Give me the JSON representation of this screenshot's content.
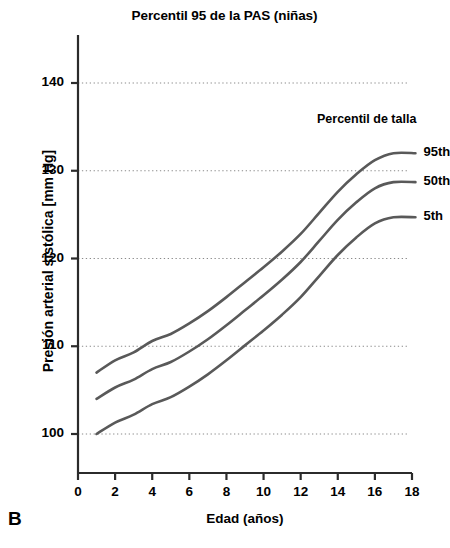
{
  "chart_data": {
    "type": "line",
    "title": "Percentil 95 de la PAS (niñas)",
    "panel_label": "B",
    "xlabel": "Edad (años)",
    "ylabel": "Presión arterial sistólica [mm Hg]",
    "xlim": [
      0,
      18
    ],
    "ylim": [
      96,
      145
    ],
    "xticks": [
      0,
      2,
      4,
      6,
      8,
      10,
      12,
      14,
      16,
      18
    ],
    "yticks": [
      100,
      110,
      120,
      130,
      140
    ],
    "grid": "horizontal-dotted",
    "legend_title": "Percentil de talla",
    "legend_position": "right-inline-at-line-ends",
    "line_color": "#595959",
    "x": [
      1,
      2,
      3,
      4,
      5,
      6,
      7,
      8,
      9,
      10,
      11,
      12,
      13,
      14,
      15,
      16,
      17
    ],
    "series": [
      {
        "name": "95th",
        "label": "95th",
        "values": [
          107.0,
          108.4,
          109.3,
          110.6,
          111.4,
          112.6,
          114.0,
          115.6,
          117.3,
          119.0,
          120.8,
          122.8,
          125.2,
          127.6,
          129.6,
          131.2,
          132.0
        ]
      },
      {
        "name": "50th",
        "label": "50th",
        "values": [
          104.0,
          105.3,
          106.2,
          107.4,
          108.2,
          109.4,
          110.8,
          112.4,
          114.1,
          115.8,
          117.6,
          119.6,
          122.0,
          124.4,
          126.4,
          128.0,
          128.7
        ]
      },
      {
        "name": "5th",
        "label": "5th",
        "values": [
          100.0,
          101.3,
          102.2,
          103.4,
          104.2,
          105.4,
          106.8,
          108.4,
          110.1,
          111.8,
          113.6,
          115.6,
          118.0,
          120.4,
          122.4,
          124.0,
          124.7
        ]
      }
    ]
  }
}
